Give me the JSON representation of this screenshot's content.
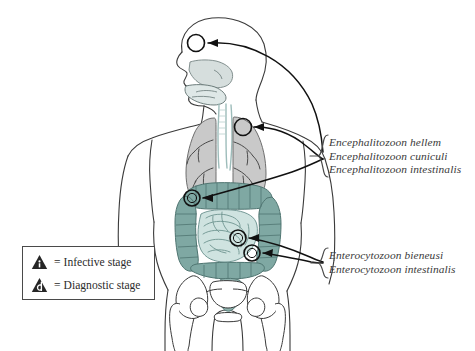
{
  "figure": {
    "colors": {
      "outline": "#2f2f2f",
      "body_outline": "#3a3a3a",
      "lung_fill": "#c9c9c9",
      "airway_fill": "#cfe0de",
      "colon_fill": "#7fa8a3",
      "small_intestine_fill": "#cfe3e0",
      "rectum_fill": "#8fb3ae",
      "bone_fill": "#ffffff",
      "leader_line": "#1a1a1a",
      "text": "#3a3a3a",
      "legend_border": "#4a4a4a",
      "legend_icon_fill": "#262626",
      "background": "#ffffff"
    },
    "markers": [
      {
        "name": "marker-head",
        "cx": 196,
        "cy": 43,
        "r": 8.5,
        "site": "nasal-cavity"
      },
      {
        "name": "marker-lung",
        "cx": 243,
        "cy": 127,
        "r": 8.5,
        "site": "lung"
      },
      {
        "name": "marker-colon-upper",
        "cx": 192,
        "cy": 198,
        "r": 8.0,
        "site": "ascending-colon"
      },
      {
        "name": "marker-small-intestine",
        "cx": 238,
        "cy": 238,
        "r": 8.0,
        "site": "small-intestine"
      },
      {
        "name": "marker-lower-intestine",
        "cx": 252,
        "cy": 253,
        "r": 8.0,
        "site": "lower-intestine"
      }
    ]
  },
  "labels": {
    "encephalitozoon": {
      "lines": [
        "Encephalitozoon hellem",
        "Encephalitozoon cuniculi",
        "Encephalitozoon intestinalis"
      ]
    },
    "enterocytozoon": {
      "lines": [
        "Enterocytozoon bieneusi",
        "Enterocytozoon intestinalis"
      ]
    }
  },
  "legend": {
    "rows": [
      {
        "icon": "infective-stage-triangle-icon",
        "glyph": "i",
        "equals": "=",
        "text": "Infective stage"
      },
      {
        "icon": "diagnostic-stage-triangle-icon",
        "glyph": "d",
        "equals": "=",
        "text": "Diagnostic stage"
      }
    ]
  }
}
